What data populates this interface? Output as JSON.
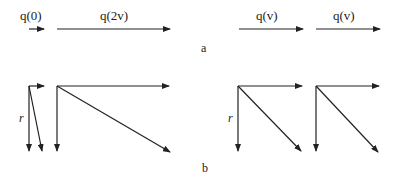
{
  "panel_a": {
    "label": "a",
    "vectors": [
      {
        "label": "q(0)",
        "x1": 29,
        "y1": 29,
        "x2": 44,
        "y2": 29
      },
      {
        "label": "q(2v)",
        "x1": 57,
        "y1": 29,
        "x2": 170,
        "y2": 29
      },
      {
        "label": "q(v)",
        "x1": 239,
        "y1": 29,
        "x2": 303,
        "y2": 29
      },
      {
        "label": "q(v)",
        "x1": 316,
        "y1": 29,
        "x2": 380,
        "y2": 29
      }
    ]
  },
  "panel_b": {
    "label": "b",
    "r_label": "r",
    "groups": [
      {
        "origin": [
          29,
          86
        ],
        "horizontal_end": [
          44,
          86
        ],
        "vertical_end": [
          29,
          151
        ],
        "diagonal_end": [
          42,
          151
        ],
        "r_label": "r"
      },
      {
        "origin": [
          57,
          86
        ],
        "horizontal_end": [
          169,
          86
        ],
        "vertical_end": [
          57,
          151
        ],
        "diagonal_end": [
          170,
          152
        ],
        "r_label": ""
      },
      {
        "origin": [
          238,
          86
        ],
        "horizontal_end": [
          302,
          86
        ],
        "vertical_end": [
          238,
          151
        ],
        "diagonal_end": [
          301,
          151
        ],
        "r_label": "r"
      },
      {
        "origin": [
          316,
          86
        ],
        "horizontal_end": [
          379,
          86
        ],
        "vertical_end": [
          316,
          151
        ],
        "diagonal_end": [
          378,
          152
        ],
        "r_label": ""
      }
    ]
  }
}
